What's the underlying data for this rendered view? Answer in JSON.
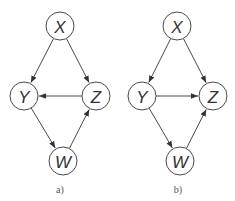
{
  "diagrams": [
    {
      "caption": "a)",
      "caption_pos": [
        60,
        193
      ],
      "nodes": [
        {
          "id": "X",
          "label": "X",
          "x": 60,
          "y": 26
        },
        {
          "id": "Y",
          "label": "Y",
          "x": 24,
          "y": 96
        },
        {
          "id": "Z",
          "label": "Z",
          "x": 96,
          "y": 96
        },
        {
          "id": "W",
          "label": "W",
          "x": 63,
          "y": 161
        }
      ],
      "edges": [
        {
          "from": "X",
          "to": "Y"
        },
        {
          "from": "X",
          "to": "Z"
        },
        {
          "from": "Z",
          "to": "Y"
        },
        {
          "from": "Y",
          "to": "W"
        },
        {
          "from": "W",
          "to": "Z"
        }
      ]
    },
    {
      "caption": "b)",
      "caption_pos": [
        178,
        193
      ],
      "nodes": [
        {
          "id": "X",
          "label": "X",
          "x": 177,
          "y": 26
        },
        {
          "id": "Y",
          "label": "Y",
          "x": 142,
          "y": 96
        },
        {
          "id": "Z",
          "label": "Z",
          "x": 213,
          "y": 96
        },
        {
          "id": "W",
          "label": "W",
          "x": 180,
          "y": 161
        }
      ],
      "edges": [
        {
          "from": "X",
          "to": "Y"
        },
        {
          "from": "X",
          "to": "Z"
        },
        {
          "from": "Y",
          "to": "Z"
        },
        {
          "from": "Y",
          "to": "W"
        },
        {
          "from": "W",
          "to": "Z"
        }
      ]
    }
  ],
  "style": {
    "node_radius": 14,
    "stroke": "#4a4a4a"
  }
}
